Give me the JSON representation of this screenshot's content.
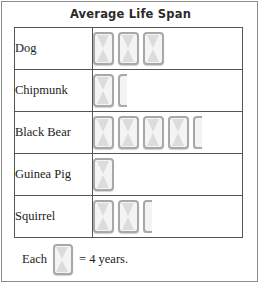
{
  "chart_data": {
    "type": "pictograph",
    "title": "Average Life Span",
    "categories": [
      "Dog",
      "Chipmunk",
      "Black Bear",
      "Guinea Pig",
      "Squirrel"
    ],
    "symbol_counts": [
      3,
      1.5,
      4.5,
      1,
      2.5
    ],
    "unit_value": 4,
    "unit_label": "years",
    "values": [
      12,
      6,
      18,
      4,
      10
    ],
    "xlabel": "",
    "ylabel": "",
    "legend": {
      "prefix": "Each",
      "equals": "= 4 years.",
      "symbol_name": "hourglass-symbol"
    },
    "rows": [
      {
        "label": "Dog",
        "full": 3,
        "half": 0,
        "value": 12
      },
      {
        "label": "Chipmunk",
        "full": 1,
        "half": 1,
        "value": 6
      },
      {
        "label": "Black Bear",
        "full": 4,
        "half": 1,
        "value": 18
      },
      {
        "label": "Guinea Pig",
        "full": 1,
        "half": 0,
        "value": 4
      },
      {
        "label": "Squirrel",
        "full": 2,
        "half": 1,
        "value": 10
      }
    ],
    "colors": {
      "symbol_fill": "#f4f4f4",
      "symbol_border": "#a8a8a8",
      "glass_fill": "#dcdcdc",
      "table_border": "#555555",
      "frame_border": "#8c8c8c",
      "text": "#222222",
      "title_text": "#2b2b2b",
      "background": "#ffffff"
    }
  }
}
